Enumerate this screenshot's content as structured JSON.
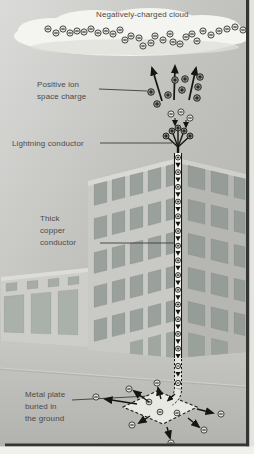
{
  "labels": {
    "cloud": "Negatively-charged cloud",
    "space_charge": [
      "Positive ion",
      "space charge"
    ],
    "lightning": "Lightning conductor",
    "copper": [
      "Thick",
      "copper",
      "conductor"
    ],
    "plate": [
      "Metal plate",
      "buried in",
      "the ground"
    ]
  },
  "symbols": {
    "negative_ion": "−",
    "positive_ion": "+"
  },
  "colors": {
    "sky_top": "#dbdbd9",
    "sky_mid": "#c2c2bf",
    "sky_bottom": "#aeaeab",
    "cloud": "#f4f4f0",
    "cloud_shadow": "#e0e0db",
    "ground_top": "#c6c6c2",
    "ground_bottom": "#b2b2ae",
    "building_left_face": "#c9c9c5",
    "building_right_face": "#b6b6b2",
    "parapet": "#d9d9d5",
    "window": "#9aa09b",
    "window_right": "#969c97",
    "door": "#a0a6a0",
    "low_building_face": "#cdcdc9",
    "low_building_window": "#a6aca6",
    "ink": "#151513",
    "label_text": "#4b4b49",
    "neg_ion_fill": "#e4e4df",
    "pos_ion_fill": "#93938f",
    "conductor_fill": "#f5f5f1",
    "plate_fill": "#e9e9e4",
    "frame_border": "#343432",
    "page_margin": "#efefec"
  },
  "diagram": {
    "cloud_ions": [
      [
        48,
        29
      ],
      [
        56,
        33
      ],
      [
        63,
        29
      ],
      [
        70,
        33
      ],
      [
        77,
        31
      ],
      [
        84,
        32
      ],
      [
        91,
        29
      ],
      [
        98,
        33
      ],
      [
        106,
        31
      ],
      [
        113,
        34
      ],
      [
        120,
        30
      ],
      [
        125,
        40
      ],
      [
        131,
        36
      ],
      [
        139,
        38
      ],
      [
        143,
        46
      ],
      [
        151,
        43
      ],
      [
        155,
        36
      ],
      [
        163,
        40
      ],
      [
        170,
        34
      ],
      [
        173,
        42
      ],
      [
        180,
        44
      ],
      [
        186,
        37
      ],
      [
        192,
        34
      ],
      [
        197,
        41
      ],
      [
        203,
        31
      ],
      [
        211,
        35
      ],
      [
        219,
        31
      ],
      [
        227,
        29
      ],
      [
        235,
        27
      ],
      [
        243,
        30
      ]
    ],
    "space_charge": {
      "arrows": [
        [
          162,
          101,
          152,
          68
        ],
        [
          174,
          100,
          175,
          66
        ],
        [
          189,
          100,
          196,
          68
        ]
      ],
      "ions": [
        [
          151,
          92
        ],
        [
          157,
          104
        ],
        [
          168,
          95
        ],
        [
          175,
          80
        ],
        [
          182,
          90
        ],
        [
          185,
          79
        ],
        [
          197,
          98
        ],
        [
          198,
          87
        ],
        [
          200,
          77
        ]
      ]
    },
    "tip": {
      "base": [
        178,
        147
      ],
      "prong_tips": [
        [
          166,
          136
        ],
        [
          172,
          131
        ],
        [
          178,
          128
        ],
        [
          184,
          131
        ],
        [
          190,
          136
        ]
      ],
      "neg_ions": [
        [
          171,
          114
        ],
        [
          181,
          112
        ],
        [
          190,
          118
        ]
      ],
      "attract_arrows": [
        [
          175,
          118,
          175,
          125
        ],
        [
          186,
          120,
          186,
          127
        ]
      ]
    },
    "conductor": {
      "x": 178,
      "width": 7,
      "top": 153,
      "ground": 358,
      "first_element_y": 157.5,
      "pitch": 7.35
    },
    "underground": {
      "neg_ions": [
        [
          178,
          366
        ],
        [
          178,
          383
        ]
      ],
      "arrowhead_y": 374,
      "entry_arrow": [
        175,
        394,
        168,
        400.5
      ]
    },
    "plate": {
      "corners": [
        [
          123,
          407
        ],
        [
          157,
          391
        ],
        [
          197,
          407
        ],
        [
          163,
          424
        ]
      ],
      "inner_neg_ions": [
        [
          149,
          402
        ],
        [
          160,
          412
        ],
        [
          177,
          413
        ]
      ],
      "out_arrows": [
        [
          137,
          404,
          105,
          399
        ],
        [
          149,
          402,
          134,
          391
        ],
        [
          161,
          399,
          158,
          388
        ],
        [
          197,
          409,
          213,
          413
        ],
        [
          188,
          418,
          199,
          427
        ],
        [
          167,
          427,
          170,
          438
        ],
        [
          150,
          416,
          139,
          423
        ]
      ],
      "outer_neg_ions": [
        [
          96,
          397
        ],
        [
          129,
          389
        ],
        [
          157,
          383
        ],
        [
          221,
          414
        ],
        [
          204,
          430
        ],
        [
          171,
          443
        ],
        [
          132,
          425
        ]
      ]
    }
  }
}
